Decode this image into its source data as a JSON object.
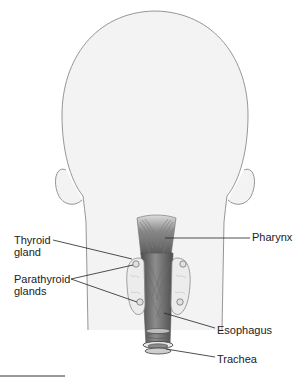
{
  "diagram": {
    "labels": {
      "thyroid": {
        "line1": "Thyroid",
        "line2": "gland"
      },
      "parathyroid": {
        "line1": "Parathyroid",
        "line2": "glands"
      },
      "pharynx": "Pharynx",
      "esophagus": "Esophagus",
      "trachea": "Trachea"
    },
    "colors": {
      "head_fill": "#f3f3f3",
      "outline": "#8a8a8a",
      "pharynx_dark": "#6a6a6a",
      "pharynx_light": "#d8d8d8",
      "gland_fill": "#ececec",
      "leader_line": "#222222",
      "text": "#222222"
    }
  }
}
